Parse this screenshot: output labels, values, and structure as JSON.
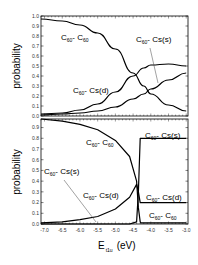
{
  "chart_data": [
    {
      "type": "line",
      "panel": "top",
      "title": "",
      "xlabel": "E_t1u (eV)",
      "ylabel": "probability",
      "xlim": [
        -7.1,
        -2.95
      ],
      "ylim": [
        0.0,
        1.0
      ],
      "yticks": [
        "0.0",
        "0.1",
        "0.2",
        "0.3",
        "0.4",
        "0.5",
        "0.6",
        "0.7",
        "0.8",
        "0.9",
        "1.0"
      ],
      "grid": false,
      "x": [
        -7.1,
        -6.5,
        -6.0,
        -5.5,
        -5.0,
        -4.5,
        -4.2,
        -4.0,
        -3.5,
        -3.0
      ],
      "series": [
        {
          "name": "C60-C60",
          "values": [
            0.97,
            0.95,
            0.91,
            0.83,
            0.67,
            0.43,
            0.3,
            0.22,
            0.11,
            0.05
          ]
        },
        {
          "name": "C60-Cs(d)",
          "values": [
            0.02,
            0.03,
            0.06,
            0.12,
            0.24,
            0.4,
            0.48,
            0.51,
            0.52,
            0.5
          ]
        },
        {
          "name": "C60-Cs(s)",
          "values": [
            0.01,
            0.02,
            0.03,
            0.05,
            0.09,
            0.17,
            0.22,
            0.27,
            0.36,
            0.43
          ]
        }
      ],
      "annotations": [
        {
          "text": "C60- C60",
          "x": -6.2,
          "y": 0.8
        },
        {
          "text": "C60- Cs(s)",
          "x": -3.7,
          "y": 0.78,
          "arrow_to": [
            -3.7,
            0.33
          ]
        },
        {
          "text": "C60- Cs(d)",
          "x": -5.6,
          "y": 0.25
        }
      ]
    },
    {
      "type": "line",
      "panel": "bottom",
      "title": "",
      "xlabel": "E_t1u (eV)",
      "ylabel": "probability",
      "xlim": [
        -7.1,
        -2.95
      ],
      "ylim": [
        0.0,
        0.98
      ],
      "yticks": [
        "0.0",
        "0.1",
        "0.2",
        "0.3",
        "0.4",
        "0.5",
        "0.6",
        "0.7",
        "0.8",
        "0.9"
      ],
      "xticks": [
        "-7.0",
        "-6.5",
        "-6.0",
        "-5.5",
        "-5.0",
        "-4.5",
        "-4.0",
        "-3.5",
        "-3.0"
      ],
      "grid": false,
      "x": [
        -7.1,
        -6.5,
        -6.0,
        -5.5,
        -5.0,
        -4.6,
        -4.4,
        -4.35,
        -4.3,
        -4.28,
        -4.0,
        -3.5,
        -3.0
      ],
      "series": [
        {
          "name": "C60-C60",
          "values": [
            0.98,
            0.96,
            0.93,
            0.88,
            0.78,
            0.63,
            0.4,
            0.15,
            0.02,
            0.01,
            0.01,
            0.01,
            0.01
          ]
        },
        {
          "name": "C60-Cs(d)",
          "values": [
            0.01,
            0.02,
            0.04,
            0.07,
            0.14,
            0.25,
            0.37,
            0.3,
            0.2,
            0.2,
            0.2,
            0.2,
            0.2
          ]
        },
        {
          "name": "C60-Cs(s)",
          "values": [
            0.0,
            0.0,
            0.0,
            0.0,
            0.0,
            0.0,
            0.02,
            0.3,
            0.8,
            0.8,
            0.8,
            0.8,
            0.8
          ]
        }
      ],
      "annotations": [
        {
          "text": "C60- C60",
          "x": -5.0,
          "y": 0.8
        },
        {
          "text": "C60- Cs(s)",
          "x": -3.7,
          "y": 0.86
        },
        {
          "text": "C60- Cs(s)",
          "x": -6.9,
          "y": 0.5,
          "arrow_to": [
            -5.55,
            0.0
          ]
        },
        {
          "text": "C60- Cs(d)",
          "x": -5.3,
          "y": 0.24
        },
        {
          "text": "C60- Cs(d)",
          "x": -3.7,
          "y": 0.23
        },
        {
          "text": "C60- C60",
          "x": -3.6,
          "y": 0.07
        }
      ]
    }
  ],
  "labels": {
    "ylabel": "probability",
    "xlabel_main": "E",
    "xlabel_sub": "t1u",
    "xlabel_unit": "(eV)",
    "c60": "C",
    "sub60": "60",
    "dash_c60": "- C",
    "dash_cs_s": "- Cs(s)",
    "dash_cs_d": "- Cs(d)"
  }
}
